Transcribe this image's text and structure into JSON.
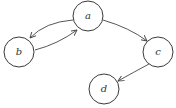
{
  "diagram": {
    "type": "directed-graph",
    "nodes": [
      {
        "id": "a",
        "label": "a",
        "cx": 88,
        "cy": 16,
        "r": 15
      },
      {
        "id": "b",
        "label": "b",
        "cx": 19,
        "cy": 52,
        "r": 15
      },
      {
        "id": "c",
        "label": "c",
        "cx": 158,
        "cy": 52,
        "r": 15
      },
      {
        "id": "d",
        "label": "d",
        "cx": 104,
        "cy": 89,
        "r": 15
      }
    ],
    "edges": [
      {
        "from": "a",
        "to": "b"
      },
      {
        "from": "b",
        "to": "a"
      },
      {
        "from": "a",
        "to": "c"
      },
      {
        "from": "c",
        "to": "d"
      }
    ],
    "colors": {
      "stroke": "#3a3a3a",
      "background": "#ffffff"
    }
  }
}
